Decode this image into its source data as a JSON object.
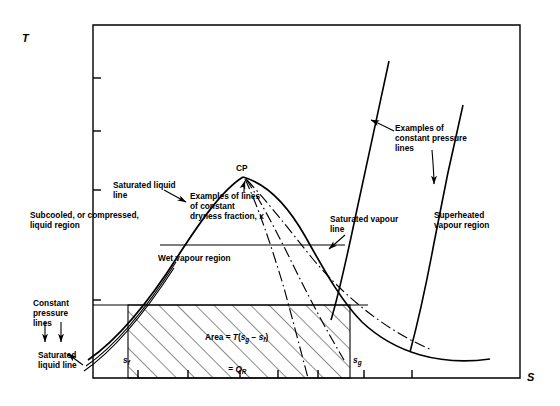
{
  "figure": {
    "type": "temperature-entropy-diagram",
    "axes": {
      "y_label": "T",
      "x_label": "S",
      "y_label_meaning": "Temperature",
      "x_label_meaning": "Entropy",
      "frame": {
        "left": 93,
        "top": 25,
        "right": 520,
        "bottom": 378
      },
      "y_ticks": 4,
      "x_ticks": 7,
      "grid": false
    },
    "critical_point": {
      "label": "CP",
      "x": 243,
      "y": 177
    },
    "regions": [
      {
        "name": "subcooled-liquid-region",
        "label": "Subcooled, or compressed,\nliquid region",
        "x": 30,
        "y": 215
      },
      {
        "name": "wet-vapour-region",
        "label": "Wet vapour region",
        "x": 158,
        "y": 258
      },
      {
        "name": "superheated-vapour-region",
        "label": "Superheated\nvapour region",
        "x": 434,
        "y": 215
      }
    ],
    "annotations": [
      {
        "name": "saturated-liquid-line-upper",
        "label": "Saturated liquid\nline",
        "x": 113,
        "y": 185
      },
      {
        "name": "dryness-fraction-lines",
        "label": "Examples of lines\nof constant\ndryness fraction, x",
        "x": 190,
        "y": 196
      },
      {
        "name": "saturated-vapour-line",
        "label": "Saturated vapour\nline",
        "x": 330,
        "y": 219
      },
      {
        "name": "constant-pressure-lines-right",
        "label": "Examples of\nconstant pressure\nlines",
        "x": 395,
        "y": 128
      },
      {
        "name": "constant-pressure-lines-left",
        "label": "Constant\npressure\nlines",
        "x": 33,
        "y": 303
      },
      {
        "name": "saturated-liquid-line-lower",
        "label": "Saturated\nliquid line",
        "x": 38,
        "y": 355
      }
    ],
    "area_formula": {
      "name": "area-formula",
      "line1_prefix": "Area = ",
      "line1_T": "T",
      "line1_open": "(",
      "line1_s1": "s",
      "line1_s1_sub": "g",
      "line1_minus": " − ",
      "line1_s2": "s",
      "line1_s2_sub": "f",
      "line1_close": ")",
      "line2_eq": "= ",
      "line2_Q": "Q",
      "line2_Q_sub": "R",
      "x": 196,
      "y": 327
    },
    "entropy_markers": [
      {
        "name": "entropy-sf-label",
        "symbol": "s",
        "subscript": "f",
        "x": 123,
        "y": 360
      },
      {
        "name": "entropy-sg-label",
        "symbol": "s",
        "subscript": "g",
        "x": 353,
        "y": 360
      }
    ],
    "hatched_area": {
      "name": "heat-rejected-area",
      "left": 128,
      "right": 350,
      "top": 305,
      "bottom": 378,
      "hatch_angle_deg": 45,
      "hatch_spacing": 13
    },
    "isotherms": [
      {
        "name": "isotherm-upper",
        "y": 245,
        "x1": 160,
        "x2": 345
      },
      {
        "name": "isotherm-lower",
        "y": 305,
        "x1": 93,
        "x2": 368
      }
    ],
    "colors": {
      "line": "#000000",
      "background": "#ffffff"
    }
  }
}
